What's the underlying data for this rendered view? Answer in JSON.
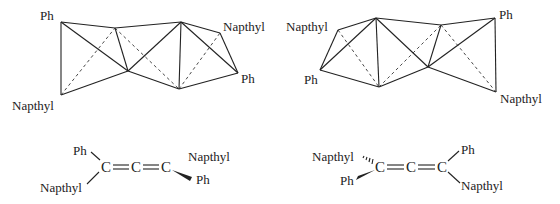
{
  "figure": {
    "left_model": {
      "labels": {
        "top_left": "Ph",
        "bottom_left": "Napthyl",
        "top_right": "Napthyl",
        "bottom_right": "Ph"
      }
    },
    "right_model": {
      "labels": {
        "top_left": "Napthyl",
        "bottom_left": "Ph",
        "top_right": "Ph",
        "bottom_right": "Napthyl"
      }
    },
    "left_formula": {
      "left_top": "Ph",
      "left_bottom": "Napthyl",
      "c1": "C",
      "c2": "C",
      "c3": "C",
      "right_top": "Napthyl",
      "right_bottom": "Ph"
    },
    "right_formula": {
      "left_top": "Napthyl",
      "left_bottom": "Ph",
      "c1": "C",
      "c2": "C",
      "c3": "C",
      "right_top": "Ph",
      "right_bottom": "Napthyl"
    },
    "colors": {
      "line": "#222222",
      "background": "#ffffff"
    }
  }
}
